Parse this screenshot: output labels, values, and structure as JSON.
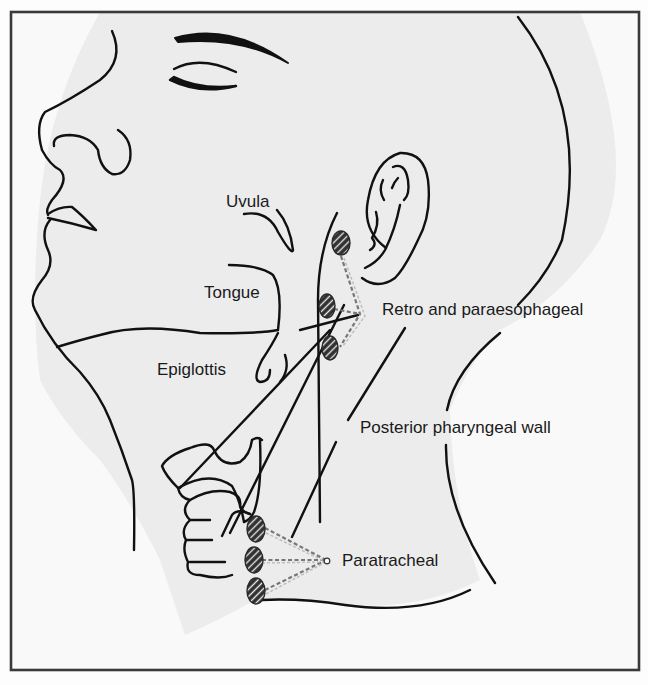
{
  "figure": {
    "type": "anatomical-diagram",
    "labels": {
      "uvula": "Uvula",
      "tongue": "Tongue",
      "epiglottis": "Epiglottis",
      "retro_paraesophageal": "Retro and paraesophageal",
      "posterior_pharyngeal_wall": "Posterior pharyngeal wall",
      "paratracheal": "Paratracheal"
    },
    "node_groups": [
      {
        "name": "Retro and paraesophageal",
        "node_count": 3
      },
      {
        "name": "Paratracheal",
        "node_count": 3
      }
    ],
    "colors": {
      "background": "#fdfdfd",
      "shaded_region": "#ececec",
      "outline": "#111111",
      "border": "#3a3a3a",
      "leader_line": "#777777",
      "node_fill": "#2e2e2e",
      "node_hatch": "#e8e8e8"
    }
  }
}
